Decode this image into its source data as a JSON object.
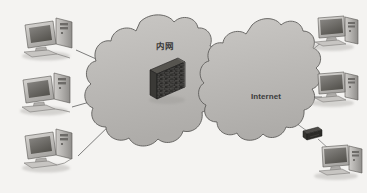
{
  "canvas": {
    "width": 367,
    "height": 193,
    "background_color": "#f4f3f1",
    "description": "Network topology diagram: internal network cloud with firewall connected through Internet cloud to external hosts"
  },
  "palette": {
    "cloud_fill": "#b9b7b4",
    "cloud_fill_light": "#c6c4c1",
    "cloud_stroke": "#5e5c5a",
    "line_color": "#6e6e6e",
    "device_dark": "#3a3a3a",
    "device_mid": "#8d8b88",
    "device_light": "#d6d4d1",
    "screen_color": "#6f6d6a",
    "text_color": "#3b3b3b",
    "shadow_color": "#a9a7a4"
  },
  "clouds": [
    {
      "id": "internal-network-cloud",
      "label": "内网",
      "label_x": 165,
      "label_y": 47,
      "center_x": 157,
      "center_y": 95
    },
    {
      "id": "internet-cloud",
      "label": "Internet",
      "label_x": 266,
      "label_y": 97,
      "center_x": 266,
      "center_y": 97
    }
  ],
  "devices": {
    "firewall": {
      "name": "firewall",
      "label": "",
      "type": "brick-wall",
      "x": 146,
      "y": 60
    },
    "left_hosts": [
      {
        "name": "workstation-left-top",
        "type": "crt-desktop-pc",
        "x": 20,
        "y": 14
      },
      {
        "name": "workstation-left-middle",
        "type": "crt-desktop-pc",
        "x": 20,
        "y": 69
      },
      {
        "name": "workstation-left-bottom",
        "type": "crt-desktop-pc",
        "x": 20,
        "y": 124
      }
    ],
    "right_hosts": [
      {
        "name": "host-right-top",
        "type": "lcd-desktop-pc",
        "x": 305,
        "y": 14
      },
      {
        "name": "host-right-middle",
        "type": "lcd-desktop-pc",
        "x": 305,
        "y": 70
      },
      {
        "name": "host-right-bottom",
        "type": "lcd-desktop-pc",
        "x": 308,
        "y": 143
      }
    ],
    "modem": {
      "name": "modem",
      "type": "small-network-box",
      "x": 303,
      "y": 127
    }
  },
  "connections": [
    {
      "from": "workstation-left-top",
      "to": "firewall"
    },
    {
      "from": "workstation-left-middle",
      "to": "firewall"
    },
    {
      "from": "workstation-left-bottom",
      "to": "firewall"
    },
    {
      "from": "internal-network-cloud",
      "to": "internet-cloud"
    },
    {
      "from": "internet-cloud",
      "to": "host-right-top"
    },
    {
      "from": "internet-cloud",
      "to": "host-right-middle"
    },
    {
      "from": "internet-cloud",
      "to": "modem"
    },
    {
      "from": "modem",
      "to": "host-right-bottom"
    }
  ]
}
